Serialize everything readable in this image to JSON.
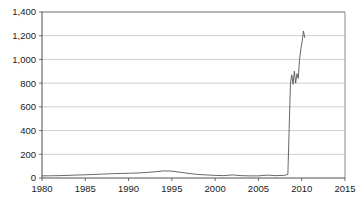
{
  "chart_data": {
    "type": "line",
    "title": "",
    "subtitle": "",
    "xlabel": "",
    "ylabel": "",
    "xlim": [
      1980,
      2015
    ],
    "ylim": [
      0,
      1400
    ],
    "grid": true,
    "legend": null,
    "legend_position": "none",
    "x_ticks": [
      1980,
      1985,
      1990,
      1995,
      2000,
      2005,
      2010,
      2015
    ],
    "x_tick_labels": [
      "1980",
      "1985",
      "1990",
      "1995",
      "2000",
      "2005",
      "2010",
      "2015"
    ],
    "y_ticks": [
      0,
      200,
      400,
      600,
      800,
      1000,
      1200,
      1400
    ],
    "y_tick_labels": [
      "0",
      "200",
      "400",
      "600",
      "800",
      "1,000",
      "1,200",
      "1,400"
    ],
    "series": [
      {
        "name": "series-1",
        "color": "#4d4d4d",
        "x": [
          1980,
          1981,
          1982,
          1983,
          1984,
          1985,
          1986,
          1987,
          1988,
          1989,
          1990,
          1991,
          1992,
          1993,
          1994,
          1995,
          1996,
          1997,
          1998,
          1999,
          2000,
          2001,
          2002,
          2003,
          2004,
          2005,
          2006,
          2007,
          2008,
          2008.4,
          2008.55,
          2008.7,
          2008.85,
          2009.0,
          2009.15,
          2009.3,
          2009.45,
          2009.6,
          2009.75,
          2009.9,
          2010.05,
          2010.2,
          2010.35
        ],
        "values": [
          18,
          19,
          20,
          22,
          25,
          27,
          30,
          33,
          36,
          38,
          40,
          42,
          46,
          52,
          60,
          58,
          48,
          38,
          30,
          26,
          22,
          20,
          26,
          20,
          18,
          18,
          24,
          20,
          22,
          30,
          420,
          800,
          870,
          790,
          900,
          800,
          880,
          840,
          1000,
          1090,
          1150,
          1240,
          1185
        ]
      }
    ]
  },
  "axes": {
    "y_axis_name": "value-axis",
    "x_axis_name": "year-axis"
  }
}
